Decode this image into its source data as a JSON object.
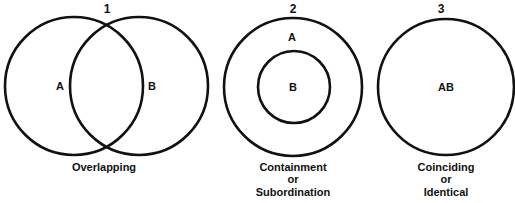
{
  "diagrams": [
    {
      "number": "1",
      "set_labels": [
        "A",
        "B"
      ],
      "caption_lines": [
        "Overlapping"
      ]
    },
    {
      "number": "2",
      "set_labels": [
        "A",
        "B"
      ],
      "caption_lines": [
        "Containment",
        "or",
        "Subordination"
      ]
    },
    {
      "number": "3",
      "set_labels": [
        "AB"
      ],
      "caption_lines": [
        "Coinciding",
        "or",
        "Identical"
      ]
    }
  ],
  "colors": {
    "stroke": "#111111",
    "background": "#ffffff"
  }
}
